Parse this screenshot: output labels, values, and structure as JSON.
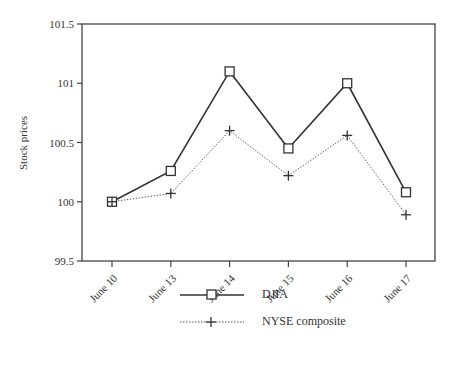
{
  "chart_data": {
    "type": "line",
    "title": "",
    "xlabel": "",
    "ylabel": "Stock prices",
    "categories": [
      "June 10",
      "June 13",
      "June 14",
      "June 15",
      "June 16",
      "June 17"
    ],
    "series": [
      {
        "name": "DJIA",
        "marker": "square",
        "line": "solid",
        "values": [
          100.0,
          100.26,
          101.1,
          100.45,
          101.0,
          100.08
        ]
      },
      {
        "name": "NYSE composite",
        "marker": "plus",
        "line": "dotted",
        "values": [
          100.0,
          100.07,
          100.6,
          100.22,
          100.56,
          99.89
        ]
      }
    ],
    "ylim": [
      99.5,
      101.5
    ],
    "yticks": [
      "99.5",
      "100",
      "100.5",
      "101",
      "101.5"
    ],
    "grid": false,
    "legend_position": "bottom"
  },
  "legend": {
    "djia": "DJIA",
    "nyse": "NYSE composite"
  }
}
